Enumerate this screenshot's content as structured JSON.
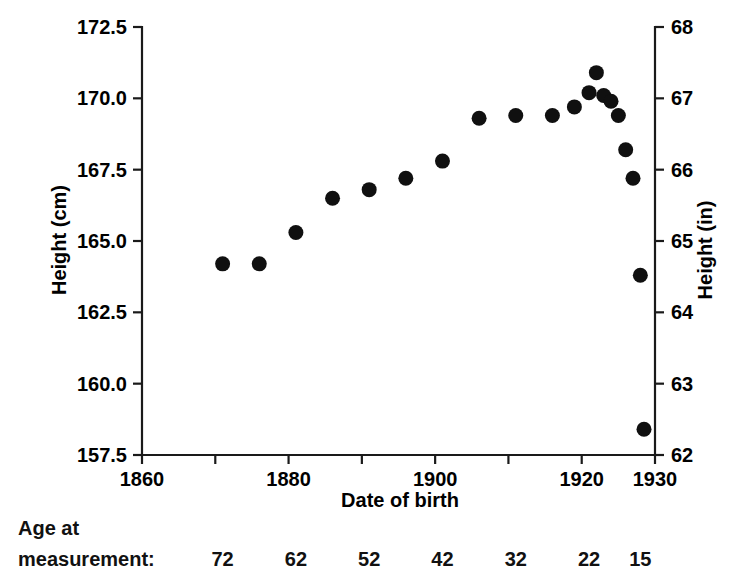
{
  "chart_data": {
    "type": "scatter",
    "title": "",
    "xlabel": "Date of birth",
    "ylabel": "Height (cm)",
    "y2label": "Height (in)",
    "xlim": [
      1860,
      1930
    ],
    "ylim": [
      157.5,
      172.5
    ],
    "y2lim": [
      62,
      68
    ],
    "grid": false,
    "legend": "none",
    "x_ticks": [
      1860,
      1880,
      1900,
      1920,
      1930
    ],
    "x_tick_labels": [
      "1860",
      "1880",
      "1900",
      "1920",
      "1930"
    ],
    "x_minor_ticks": [
      1870,
      1890,
      1910
    ],
    "y_ticks": [
      157.5,
      160.0,
      162.5,
      165.0,
      167.5,
      170.0,
      172.5
    ],
    "y_tick_labels": [
      "157.5",
      "160.0",
      "162.5",
      "165.0",
      "167.5",
      "170.0",
      "172.5"
    ],
    "y2_ticks": [
      62,
      63,
      64,
      65,
      66,
      67,
      68
    ],
    "y2_tick_labels": [
      "62",
      "63",
      "64",
      "65",
      "66",
      "67",
      "68"
    ],
    "x": [
      1871,
      1876,
      1881,
      1886,
      1891,
      1896,
      1901,
      1906,
      1911,
      1916,
      1919,
      1921,
      1922,
      1923,
      1924,
      1925,
      1926,
      1927,
      1928
    ],
    "y": [
      164.2,
      164.2,
      165.3,
      166.5,
      166.8,
      167.2,
      167.8,
      169.3,
      169.4,
      169.4,
      169.7,
      170.2,
      170.9,
      170.1,
      169.9,
      169.4,
      168.2,
      167.2,
      163.8
    ],
    "points": [
      {
        "x": 1871,
        "y": 164.2
      },
      {
        "x": 1876,
        "y": 164.2
      },
      {
        "x": 1881,
        "y": 165.3
      },
      {
        "x": 1886,
        "y": 166.5
      },
      {
        "x": 1891,
        "y": 166.8
      },
      {
        "x": 1896,
        "y": 167.2
      },
      {
        "x": 1901,
        "y": 167.8
      },
      {
        "x": 1906,
        "y": 169.3
      },
      {
        "x": 1911,
        "y": 169.4
      },
      {
        "x": 1916,
        "y": 169.4
      },
      {
        "x": 1919,
        "y": 169.7
      },
      {
        "x": 1921,
        "y": 170.2
      },
      {
        "x": 1922,
        "y": 170.9
      },
      {
        "x": 1923,
        "y": 170.1
      },
      {
        "x": 1924,
        "y": 169.9
      },
      {
        "x": 1925,
        "y": 169.4
      },
      {
        "x": 1926,
        "y": 168.2
      },
      {
        "x": 1927,
        "y": 167.2
      },
      {
        "x": 1928,
        "y": 163.8
      },
      {
        "x": 1928.5,
        "y": 158.4
      }
    ],
    "marker": "filled-circle",
    "marker_color": "#101010",
    "secondary_axis_note": "right axis shows same heights converted to inches"
  },
  "annotations": {
    "age_row_label_line1": "Age at",
    "age_row_label_line2": "measurement:",
    "age_values": [
      "72",
      "62",
      "52",
      "42",
      "32",
      "22",
      "15"
    ],
    "age_value_years": [
      1871,
      1881,
      1891,
      1901,
      1911,
      1921,
      1928
    ]
  },
  "colors": {
    "axis": "#1a1a1a",
    "marker": "#101010",
    "background": "#ffffff",
    "text": "#000000"
  }
}
